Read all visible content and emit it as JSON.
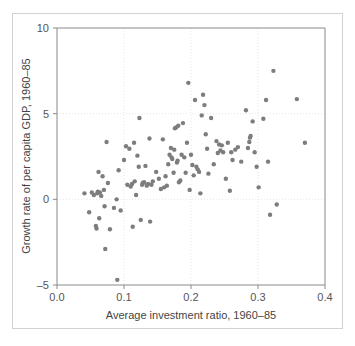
{
  "chart_data": {
    "type": "scatter",
    "title": "",
    "xlabel": "Average investment ratio, 1960–85",
    "ylabel": "Growth rate of per capita GDP, 1960–85",
    "xlim": [
      0.0,
      0.4
    ],
    "ylim": [
      -5,
      10
    ],
    "xticks": [
      "0.0",
      "0.1",
      "0.2",
      "0.3",
      "0.4"
    ],
    "xtick_values": [
      0.0,
      0.1,
      0.2,
      0.3,
      0.4
    ],
    "yticks": [
      "-5",
      "0",
      "5",
      "10"
    ],
    "ytick_values": [
      -5,
      0,
      5,
      10
    ],
    "grid": "dotted-light-at-ticks",
    "legend": "none",
    "marker": {
      "shape": "circle",
      "color": "#7d7d7d",
      "radius": 2.2
    },
    "point_count": 118,
    "points": [
      [
        0.041,
        0.35
      ],
      [
        0.048,
        -0.75
      ],
      [
        0.052,
        0.4
      ],
      [
        0.055,
        0.25
      ],
      [
        0.058,
        -1.55
      ],
      [
        0.059,
        -1.7
      ],
      [
        0.06,
        0.35
      ],
      [
        0.061,
        0.45
      ],
      [
        0.062,
        1.6
      ],
      [
        0.063,
        -1.1
      ],
      [
        0.064,
        0.4
      ],
      [
        0.066,
        0.2
      ],
      [
        0.068,
        1.35
      ],
      [
        0.07,
        0.55
      ],
      [
        0.071,
        -0.4
      ],
      [
        0.072,
        -2.9
      ],
      [
        0.074,
        3.35
      ],
      [
        0.076,
        0.95
      ],
      [
        0.079,
        -1.75
      ],
      [
        0.085,
        -0.5
      ],
      [
        0.089,
        0.0
      ],
      [
        0.09,
        -4.7
      ],
      [
        0.092,
        1.7
      ],
      [
        0.095,
        -0.65
      ],
      [
        0.1,
        2.3
      ],
      [
        0.103,
        3.1
      ],
      [
        0.105,
        0.85
      ],
      [
        0.108,
        2.95
      ],
      [
        0.11,
        0.75
      ],
      [
        0.112,
        0.9
      ],
      [
        0.113,
        -1.6
      ],
      [
        0.115,
        3.3
      ],
      [
        0.116,
        1.05
      ],
      [
        0.118,
        0.25
      ],
      [
        0.12,
        2.55
      ],
      [
        0.122,
        1.9
      ],
      [
        0.123,
        4.75
      ],
      [
        0.125,
        -1.2
      ],
      [
        0.127,
        0.85
      ],
      [
        0.128,
        0.95
      ],
      [
        0.13,
        1.0
      ],
      [
        0.132,
        1.95
      ],
      [
        0.134,
        0.8
      ],
      [
        0.136,
        0.9
      ],
      [
        0.138,
        3.55
      ],
      [
        0.139,
        -1.3
      ],
      [
        0.141,
        0.85
      ],
      [
        0.143,
        1.05
      ],
      [
        0.148,
        1.6
      ],
      [
        0.152,
        1.2
      ],
      [
        0.155,
        0.6
      ],
      [
        0.158,
        3.5
      ],
      [
        0.16,
        0.7
      ],
      [
        0.162,
        1.35
      ],
      [
        0.164,
        0.8
      ],
      [
        0.166,
        2.05
      ],
      [
        0.168,
        2.6
      ],
      [
        0.17,
        3.0
      ],
      [
        0.171,
        2.45
      ],
      [
        0.172,
        2.35
      ],
      [
        0.174,
        1.55
      ],
      [
        0.175,
        2.9
      ],
      [
        0.176,
        4.15
      ],
      [
        0.178,
        4.2
      ],
      [
        0.179,
        2.15
      ],
      [
        0.18,
        2.25
      ],
      [
        0.181,
        4.3
      ],
      [
        0.182,
        1.0
      ],
      [
        0.184,
        1.1
      ],
      [
        0.186,
        2.6
      ],
      [
        0.188,
        4.45
      ],
      [
        0.19,
        2.45
      ],
      [
        0.192,
        1.55
      ],
      [
        0.194,
        3.3
      ],
      [
        0.196,
        6.8
      ],
      [
        0.198,
        0.55
      ],
      [
        0.2,
        2.6
      ],
      [
        0.202,
        2.0
      ],
      [
        0.204,
        1.4
      ],
      [
        0.206,
        5.8
      ],
      [
        0.208,
        1.9
      ],
      [
        0.21,
        1.75
      ],
      [
        0.212,
        1.6
      ],
      [
        0.214,
        0.35
      ],
      [
        0.216,
        4.9
      ],
      [
        0.218,
        6.1
      ],
      [
        0.22,
        5.5
      ],
      [
        0.222,
        3.8
      ],
      [
        0.224,
        2.95
      ],
      [
        0.226,
        1.5
      ],
      [
        0.23,
        4.75
      ],
      [
        0.234,
        2.05
      ],
      [
        0.238,
        3.4
      ],
      [
        0.24,
        2.7
      ],
      [
        0.242,
        3.2
      ],
      [
        0.244,
        2.85
      ],
      [
        0.246,
        3.15
      ],
      [
        0.248,
        2.75
      ],
      [
        0.252,
        1.2
      ],
      [
        0.255,
        3.3
      ],
      [
        0.258,
        0.5
      ],
      [
        0.26,
        2.75
      ],
      [
        0.262,
        2.3
      ],
      [
        0.266,
        2.9
      ],
      [
        0.27,
        3.05
      ],
      [
        0.275,
        2.2
      ],
      [
        0.282,
        5.2
      ],
      [
        0.285,
        3.0
      ],
      [
        0.287,
        3.35
      ],
      [
        0.288,
        3.6
      ],
      [
        0.289,
        3.7
      ],
      [
        0.292,
        4.55
      ],
      [
        0.295,
        2.75
      ],
      [
        0.298,
        1.9
      ],
      [
        0.301,
        0.7
      ],
      [
        0.308,
        4.7
      ],
      [
        0.312,
        5.8
      ],
      [
        0.315,
        2.2
      ],
      [
        0.318,
        -0.9
      ],
      [
        0.323,
        7.5
      ],
      [
        0.328,
        -0.3
      ],
      [
        0.358,
        5.85
      ],
      [
        0.37,
        3.3
      ]
    ]
  },
  "colors": {
    "marker": "#7d7d7d",
    "axis_line": "#8a8a8a",
    "grid": "#e6e6e6",
    "frame": "#d2d2d2",
    "tick_text": "#555555",
    "axis_title_text": "#444444",
    "background": "#ffffff"
  }
}
